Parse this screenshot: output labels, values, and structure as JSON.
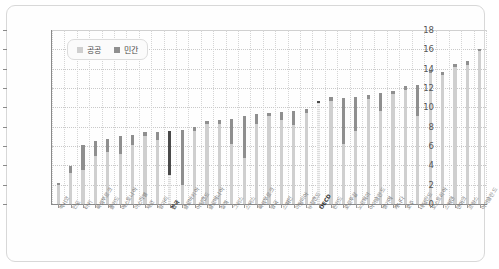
{
  "chart_data": {
    "type": "bar",
    "stacked": true,
    "title": "",
    "xlabel": "",
    "ylabel": "",
    "ylim": [
      0,
      18
    ],
    "ytick_step": 2,
    "yticks": [
      0,
      2,
      4,
      6,
      8,
      10,
      12,
      14,
      16,
      18
    ],
    "grid": true,
    "legend_position": "top-left",
    "legend": [
      "공공",
      "민간"
    ],
    "series": [
      {
        "name": "공공",
        "color": "#cfcfcf",
        "values": [
          2.0,
          3.2,
          3.5,
          5.0,
          5.4,
          5.2,
          6.1,
          7.0,
          6.6,
          3.0,
          2.0,
          7.6,
          8.3,
          8.3,
          6.2,
          4.8,
          8.3,
          9.1,
          8.7,
          8.2,
          9.4,
          10.4,
          10.7,
          6.2,
          7.6,
          10.9,
          9.6,
          11.4,
          11.8,
          9.1,
          13.6,
          13.3,
          14.2,
          14.4,
          15.8
        ]
      },
      {
        "name": "민간",
        "color": "#8f8f8f",
        "values": [
          0.2,
          0.7,
          2.6,
          1.5,
          1.3,
          1.8,
          1.0,
          0.4,
          0.9,
          4.6,
          5.7,
          0.4,
          0.3,
          0.4,
          2.6,
          4.3,
          1.0,
          0.3,
          0.8,
          1.4,
          0.4,
          0.3,
          0.4,
          4.8,
          3.5,
          0.4,
          1.9,
          0.3,
          0.4,
          3.2,
          0.3,
          0.4,
          0.3,
          0.4,
          0.2
        ]
      }
    ],
    "categories": [
      "멕시코",
      "인도",
      "터키",
      "룩셈부르크",
      "폴란드",
      "에스토니아",
      "이스라엘",
      "체코",
      "헝가리",
      "한국",
      "슬로바키아",
      "아일랜드",
      "슬로베니아",
      "칠레",
      "그리스",
      "스위스",
      "룩셈부르크",
      "영국",
      "스페인",
      "이탈리아",
      "뉴질랜드",
      "OECD",
      "핀란드",
      "포르투갈",
      "노르웨이",
      "아이슬란드",
      "벨기에",
      "캐나다",
      "호주",
      "네덜란드",
      "오스트리아",
      "스웨덴",
      "덴마크",
      "프랑스",
      "아이슬란드"
    ],
    "highlighted": [
      "OECD",
      "한국"
    ]
  }
}
